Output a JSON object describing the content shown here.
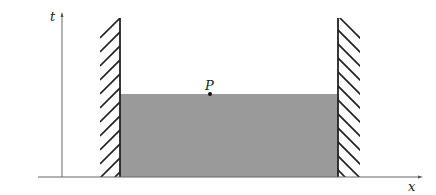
{
  "diagram": {
    "axes": {
      "vertical_label": "t",
      "horizontal_label": "x"
    },
    "point": {
      "label": "P"
    },
    "colors": {
      "fill_region": "#9a9a9a",
      "axis": "#555555",
      "wall": "#222222",
      "background": "#ffffff"
    },
    "elements": [
      "t-axis (vertical, arrow up)",
      "x-axis (horizontal, arrow right)",
      "left hatched wall",
      "right hatched wall",
      "gray shaded region between walls",
      "point P on top edge of region"
    ]
  }
}
